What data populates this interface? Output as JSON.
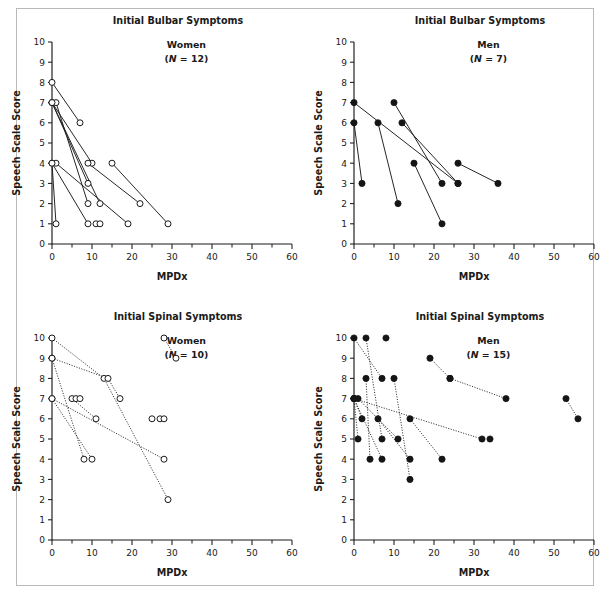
{
  "figure": {
    "width": 610,
    "height": 600,
    "background": "#ffffff",
    "frame_color": "#b9b9b9",
    "ink_color": "#1a1a1a"
  },
  "axes": {
    "x_label": "MPDx",
    "y_label": "Speech Scale Score",
    "x_ticks": [
      "0",
      "10",
      "20",
      "30",
      "40",
      "50",
      "60"
    ],
    "y_ticks": [
      "0",
      "1",
      "2",
      "3",
      "4",
      "5",
      "6",
      "7",
      "8",
      "9",
      "10"
    ],
    "xlim": [
      0,
      60
    ],
    "ylim": [
      0,
      10
    ],
    "x_minor_step": 5,
    "y_minor_step": 1
  },
  "panels": [
    {
      "key": "bulbar_women",
      "title": "Initial Bulbar Symptoms",
      "group_label": "Women",
      "group_n_prefix": "(",
      "group_n_italic": "N",
      "group_n_suffix": " = 12)",
      "n": 12,
      "marker": "open-circle",
      "line_style": "solid"
    },
    {
      "key": "bulbar_men",
      "title": "Initial Bulbar Symptoms",
      "group_label": "Men",
      "group_n_prefix": "(",
      "group_n_italic": "N",
      "group_n_suffix": " = 7)",
      "n": 7,
      "marker": "filled-circle",
      "line_style": "solid"
    },
    {
      "key": "spinal_women",
      "title": "Initial Spinal Symptoms",
      "group_label": "Women",
      "group_n_prefix": "(",
      "group_n_italic": "N",
      "group_n_suffix": " = 10)",
      "n": 10,
      "marker": "open-circle",
      "line_style": "dotted"
    },
    {
      "key": "spinal_men",
      "title": "Initial Spinal Symptoms",
      "group_label": "Men",
      "group_n_prefix": "(",
      "group_n_italic": "N",
      "group_n_suffix": " = 15)",
      "n": 15,
      "marker": "filled-circle",
      "line_style": "dotted"
    }
  ],
  "chart_data": [
    {
      "type": "line",
      "key": "bulbar_women",
      "title": "Initial Bulbar Symptoms",
      "subtitle": "Women (N = 12)",
      "xlabel": "MPDx",
      "ylabel": "Speech Scale Score",
      "xlim": [
        0,
        60
      ],
      "ylim": [
        0,
        10
      ],
      "grid": false,
      "legend": "none",
      "marker": "open-circle",
      "line_style": "solid",
      "series": [
        {
          "name": "subject-1",
          "x": [
            0,
            7
          ],
          "y": [
            8,
            6
          ]
        },
        {
          "name": "subject-2",
          "x": [
            0,
            10
          ],
          "y": [
            7,
            4
          ]
        },
        {
          "name": "subject-3",
          "x": [
            0,
            9
          ],
          "y": [
            7,
            3
          ]
        },
        {
          "name": "subject-4",
          "x": [
            1,
            9
          ],
          "y": [
            7,
            2
          ]
        },
        {
          "name": "subject-5",
          "x": [
            0,
            12
          ],
          "y": [
            7,
            2
          ]
        },
        {
          "name": "subject-6",
          "x": [
            0,
            9
          ],
          "y": [
            4,
            1
          ]
        },
        {
          "name": "subject-7",
          "x": [
            1,
            19
          ],
          "y": [
            4,
            1
          ]
        },
        {
          "name": "subject-8",
          "x": [
            9,
            22
          ],
          "y": [
            4,
            2
          ]
        },
        {
          "name": "subject-9",
          "x": [
            15,
            29
          ],
          "y": [
            4,
            1
          ]
        },
        {
          "name": "subject-10",
          "x": [
            0,
            1
          ],
          "y": [
            4,
            1
          ]
        },
        {
          "name": "subject-11",
          "x": [
            11
          ],
          "y": [
            1
          ]
        },
        {
          "name": "subject-12",
          "x": [
            12
          ],
          "y": [
            1
          ]
        }
      ]
    },
    {
      "type": "line",
      "key": "bulbar_men",
      "title": "Initial Bulbar Symptoms",
      "subtitle": "Men (N = 7)",
      "xlabel": "MPDx",
      "ylabel": "Speech Scale Score",
      "xlim": [
        0,
        60
      ],
      "ylim": [
        0,
        10
      ],
      "grid": false,
      "legend": "none",
      "marker": "filled-circle",
      "line_style": "solid",
      "series": [
        {
          "name": "subject-1",
          "x": [
            0,
            2
          ],
          "y": [
            6,
            3
          ]
        },
        {
          "name": "subject-2",
          "x": [
            0,
            26
          ],
          "y": [
            7,
            3
          ]
        },
        {
          "name": "subject-3",
          "x": [
            6,
            11
          ],
          "y": [
            6,
            2
          ]
        },
        {
          "name": "subject-4",
          "x": [
            10,
            22
          ],
          "y": [
            7,
            3
          ]
        },
        {
          "name": "subject-5",
          "x": [
            12,
            26
          ],
          "y": [
            6,
            3
          ]
        },
        {
          "name": "subject-6",
          "x": [
            15,
            22
          ],
          "y": [
            4,
            1
          ]
        },
        {
          "name": "subject-7",
          "x": [
            26,
            36
          ],
          "y": [
            4,
            3
          ]
        }
      ]
    },
    {
      "type": "line",
      "key": "spinal_women",
      "title": "Initial Spinal Symptoms",
      "subtitle": "Women (N = 10)",
      "xlabel": "MPDx",
      "ylabel": "Speech Scale Score",
      "xlim": [
        0,
        60
      ],
      "ylim": [
        0,
        10
      ],
      "grid": false,
      "legend": "none",
      "marker": "open-circle",
      "line_style": "dotted",
      "series": [
        {
          "name": "subject-1",
          "x": [
            0,
            13,
            29
          ],
          "y": [
            10,
            8,
            2
          ]
        },
        {
          "name": "subject-2",
          "x": [
            0,
            14,
            17
          ],
          "y": [
            9,
            8,
            7
          ]
        },
        {
          "name": "subject-3",
          "x": [
            0,
            8
          ],
          "y": [
            9,
            4
          ]
        },
        {
          "name": "subject-4",
          "x": [
            0,
            10
          ],
          "y": [
            7,
            4
          ]
        },
        {
          "name": "subject-5",
          "x": [
            0,
            28
          ],
          "y": [
            7,
            4
          ]
        },
        {
          "name": "subject-6",
          "x": [
            5,
            11
          ],
          "y": [
            7,
            6
          ]
        },
        {
          "name": "subject-7",
          "x": [
            6
          ],
          "y": [
            7
          ]
        },
        {
          "name": "subject-8",
          "x": [
            7
          ],
          "y": [
            7
          ]
        },
        {
          "name": "subject-9",
          "x": [
            25
          ],
          "y": [
            6
          ]
        },
        {
          "name": "subject-10",
          "x": [
            27,
            28
          ],
          "y": [
            6,
            6
          ]
        },
        {
          "name": "subject-11",
          "x": [
            28,
            31
          ],
          "y": [
            10,
            9
          ]
        }
      ]
    },
    {
      "type": "line",
      "key": "spinal_men",
      "title": "Initial Spinal Symptoms",
      "subtitle": "Men (N = 15)",
      "xlabel": "MPDx",
      "ylabel": "Speech Scale Score",
      "xlim": [
        0,
        60
      ],
      "ylim": [
        0,
        10
      ],
      "grid": false,
      "legend": "none",
      "marker": "filled-circle",
      "line_style": "dotted",
      "series": [
        {
          "name": "subject-1",
          "x": [
            0,
            7
          ],
          "y": [
            10,
            8
          ]
        },
        {
          "name": "subject-2",
          "x": [
            3,
            7
          ],
          "y": [
            10,
            5
          ]
        },
        {
          "name": "subject-3",
          "x": [
            8
          ],
          "y": [
            10
          ]
        },
        {
          "name": "subject-4",
          "x": [
            3,
            4
          ],
          "y": [
            8,
            4
          ]
        },
        {
          "name": "subject-5",
          "x": [
            10,
            14
          ],
          "y": [
            8,
            3
          ]
        },
        {
          "name": "subject-6",
          "x": [
            0,
            2
          ],
          "y": [
            7,
            6
          ]
        },
        {
          "name": "subject-7",
          "x": [
            0,
            32
          ],
          "y": [
            7,
            5
          ]
        },
        {
          "name": "subject-8",
          "x": [
            0,
            1
          ],
          "y": [
            7,
            5
          ]
        },
        {
          "name": "subject-9",
          "x": [
            0,
            7
          ],
          "y": [
            7,
            4
          ]
        },
        {
          "name": "subject-10",
          "x": [
            1,
            11
          ],
          "y": [
            7,
            5
          ]
        },
        {
          "name": "subject-11",
          "x": [
            6,
            14
          ],
          "y": [
            6,
            4
          ]
        },
        {
          "name": "subject-12",
          "x": [
            14,
            22
          ],
          "y": [
            6,
            4
          ]
        },
        {
          "name": "subject-13",
          "x": [
            19,
            24
          ],
          "y": [
            9,
            8
          ]
        },
        {
          "name": "subject-14",
          "x": [
            24,
            38
          ],
          "y": [
            8,
            7
          ]
        },
        {
          "name": "subject-15",
          "x": [
            34
          ],
          "y": [
            5
          ]
        },
        {
          "name": "subject-16",
          "x": [
            53,
            56
          ],
          "y": [
            7,
            6
          ]
        }
      ]
    }
  ]
}
